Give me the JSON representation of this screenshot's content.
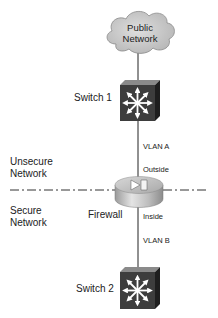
{
  "diagram": {
    "type": "network-topology",
    "nodes": [
      {
        "id": "public-network",
        "kind": "cloud",
        "label_line1": "Public",
        "label_line2": "Network"
      },
      {
        "id": "switch1",
        "kind": "multilayer-switch",
        "label": "Switch 1"
      },
      {
        "id": "firewall",
        "kind": "firewall",
        "label": "Firewall"
      },
      {
        "id": "switch2",
        "kind": "multilayer-switch",
        "label": "Switch 2"
      }
    ],
    "links": [
      {
        "from": "public-network",
        "to": "switch1",
        "label": ""
      },
      {
        "from": "switch1",
        "to": "firewall",
        "label": "VLAN A",
        "interface": "Outside"
      },
      {
        "from": "firewall",
        "to": "switch2",
        "label": "VLAN B",
        "interface": "Inside"
      }
    ],
    "zones": {
      "unsecure_line1": "Unsecure",
      "unsecure_line2": "Network",
      "secure_line1": "Secure",
      "secure_line2": "Network"
    },
    "labels": {
      "cloud_line1": "Public",
      "cloud_line2": "Network",
      "switch1": "Switch 1",
      "switch2": "Switch 2",
      "firewall": "Firewall",
      "vlan_a": "VLAN A",
      "vlan_b": "VLAN B",
      "outside": "Outside",
      "inside": "Inside"
    },
    "colors": {
      "cloud_fill": "#cfcfcf",
      "switch_front": "#3d3d3d",
      "switch_top": "#8a8a8a",
      "switch_side": "#1e1e1e",
      "firewall_fill": "#bdbdbd",
      "line": "#222222"
    }
  }
}
